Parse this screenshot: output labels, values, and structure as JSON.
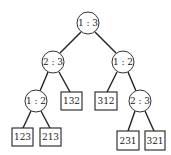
{
  "diagram": {
    "type": "decision-tree",
    "internal_nodes": [
      {
        "id": "root",
        "label": "1 : 3",
        "cx": 88,
        "cy": 23
      },
      {
        "id": "l",
        "label": "2 : 3",
        "cx": 53,
        "cy": 62
      },
      {
        "id": "r",
        "label": "1 : 2",
        "cx": 123,
        "cy": 62
      },
      {
        "id": "ll",
        "label": "1 : 2",
        "cx": 36,
        "cy": 101
      },
      {
        "id": "rr",
        "label": "2 : 3",
        "cx": 140,
        "cy": 101
      }
    ],
    "leaves": [
      {
        "id": "lr",
        "label": "132",
        "x": 61,
        "y": 92,
        "w": 21,
        "h": 18
      },
      {
        "id": "rl",
        "label": "312",
        "x": 95,
        "y": 92,
        "w": 22,
        "h": 18
      },
      {
        "id": "lll",
        "label": "123",
        "x": 12,
        "y": 128,
        "w": 21,
        "h": 18
      },
      {
        "id": "llr",
        "label": "213",
        "x": 40,
        "y": 128,
        "w": 21,
        "h": 18
      },
      {
        "id": "rrl",
        "label": "231",
        "x": 117,
        "y": 131,
        "w": 22,
        "h": 19
      },
      {
        "id": "rrr",
        "label": "321",
        "x": 145,
        "y": 131,
        "w": 20,
        "h": 19
      }
    ]
  }
}
